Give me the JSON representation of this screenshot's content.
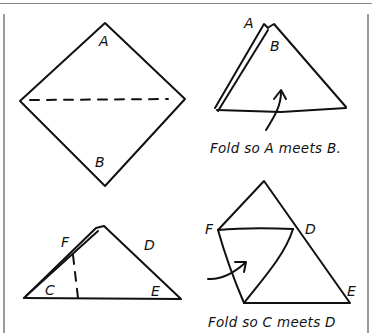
{
  "panels": {
    "step1": {
      "labels": {
        "top": "A",
        "bottom": "B"
      },
      "fold_line": "dashed-horizontal"
    },
    "step2": {
      "labels": {
        "back_flap": "A",
        "front": "B"
      },
      "caption": "Fold so A meets B."
    },
    "step3": {
      "labels": {
        "f": "F",
        "d": "D",
        "c": "C",
        "e": "E"
      },
      "fold_line": "dashed-vertical"
    },
    "step4": {
      "labels": {
        "f": "F",
        "d": "D",
        "e": "E"
      },
      "caption": "Fold so C meets D"
    }
  },
  "colors": {
    "ink": "#111111",
    "frame": "#8a8a8a",
    "background": "#ffffff"
  }
}
